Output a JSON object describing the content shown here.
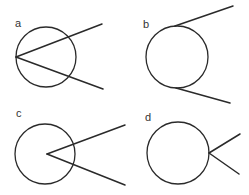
{
  "figure": {
    "panels": [
      {
        "label": "a",
        "description": "Two rays from a vertex on the circle, both crossing the circle (inscribed angle)",
        "label_pos": [
          15,
          27
        ],
        "circle": {
          "cx": 46,
          "cy": 57,
          "r": 30
        },
        "vertex": [
          16,
          57
        ],
        "rays": [
          [
            102,
            24
          ],
          [
            103,
            89
          ]
        ]
      },
      {
        "label": "b",
        "description": "Two tangent lines touching the circle at two separate points",
        "label_pos": [
          143,
          28
        ],
        "circle": {
          "cx": 177,
          "cy": 57,
          "r": 31
        },
        "segments": [
          {
            "from": [
              175,
              26
            ],
            "to": [
              233,
              6
            ]
          },
          {
            "from": [
              176,
              88
            ],
            "to": [
              230,
              103
            ]
          }
        ]
      },
      {
        "label": "c",
        "description": "Vertex inside the circle, two rays crossing the circle",
        "label_pos": [
          16,
          117
        ],
        "circle": {
          "cx": 45,
          "cy": 154,
          "r": 30
        },
        "vertex": [
          47,
          154
        ],
        "rays": [
          [
            125,
            125
          ],
          [
            125,
            185
          ]
        ]
      },
      {
        "label": "d",
        "description": "Vertex on the circle, two rays pointing outward (exterior)",
        "label_pos": [
          145,
          121
        ],
        "circle": {
          "cx": 178,
          "cy": 153,
          "r": 31
        },
        "vertex": [
          209,
          153
        ],
        "rays": [
          [
            240,
            134
          ],
          [
            239,
            174
          ]
        ]
      }
    ],
    "colors": {
      "stroke": "#2a2a2a",
      "label": "#333333",
      "background": "#ffffff"
    }
  }
}
